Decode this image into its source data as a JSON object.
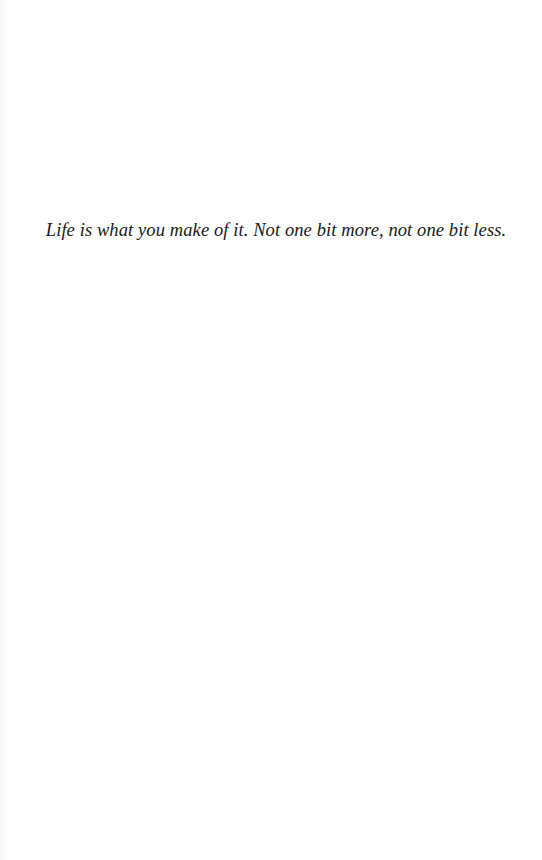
{
  "page": {
    "background": "#ffffff",
    "text_color": "#1a1a1a"
  },
  "epigraph": {
    "text": "Life is what you make of it. Not one bit more, not one bit less."
  }
}
